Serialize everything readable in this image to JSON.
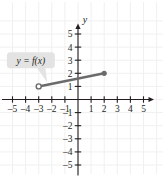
{
  "figure": {
    "title": "",
    "callout": {
      "text": "y = f(x)",
      "box_color": "#e3e3e3"
    }
  },
  "chart_data": {
    "type": "line",
    "title": "",
    "xlabel": "x",
    "ylabel": "y",
    "xlim": [
      -5.8,
      5.8
    ],
    "ylim": [
      -5.8,
      5.8
    ],
    "grid": true,
    "grid_color": "#f0f0f0",
    "axis_color": "#231f20",
    "series": [
      {
        "name": "f",
        "color": "#6b6b6b",
        "x": [
          -3,
          2
        ],
        "y": [
          1,
          2
        ],
        "endpoint_left": "open",
        "endpoint_right": "closed"
      }
    ],
    "x_ticks": [
      -5,
      -4,
      -3,
      -2,
      -1,
      1,
      2,
      3,
      4,
      5
    ],
    "y_ticks": [
      -5,
      -4,
      -3,
      -2,
      -1,
      1,
      2,
      3,
      4,
      5
    ],
    "x_tick_labels": [
      "–5",
      "–4",
      "–3",
      "–2",
      "–1",
      "1",
      "2",
      "3",
      "4",
      "5"
    ],
    "y_tick_labels": [
      "–5",
      "–4",
      "–3",
      "–2",
      "–1",
      "1",
      "2",
      "3",
      "4",
      "5"
    ],
    "annotations": [
      {
        "text": "y = f(x)",
        "x": -3.6,
        "y": 3.0
      }
    ]
  }
}
